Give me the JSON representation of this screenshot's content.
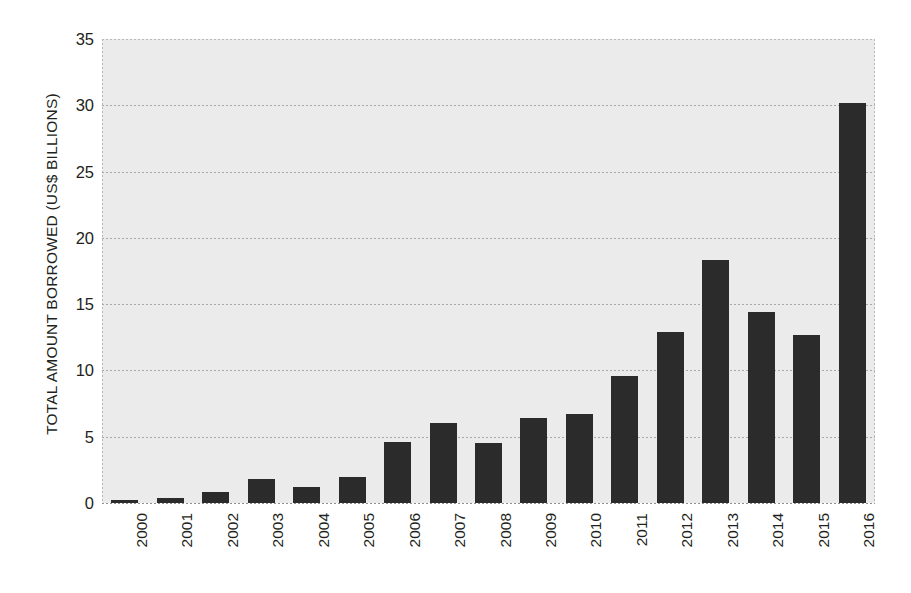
{
  "chart_data": {
    "type": "bar",
    "title": "",
    "xlabel": "",
    "ylabel": "TOTAL AMOUNT BORROWED (US$ BILLIONS)",
    "categories": [
      "2000",
      "2001",
      "2002",
      "2003",
      "2004",
      "2005",
      "2006",
      "2007",
      "2008",
      "2009",
      "2010",
      "2011",
      "2012",
      "2013",
      "2014",
      "2015",
      "2016"
    ],
    "values": [
      0.2,
      0.4,
      0.8,
      1.8,
      1.2,
      2.0,
      4.6,
      6.0,
      4.5,
      6.4,
      6.7,
      9.6,
      12.9,
      18.3,
      14.4,
      12.7,
      30.2
    ],
    "ylim": [
      0,
      35
    ],
    "ytick_labels": [
      "0",
      "5",
      "10",
      "15",
      "20",
      "25",
      "30",
      "35"
    ],
    "ytick_values": [
      0,
      5,
      10,
      15,
      20,
      25,
      30,
      35
    ],
    "grid": true,
    "legend": "none",
    "colors": {
      "bar": "#2b2b2b",
      "plot_background": "#ebebeb",
      "gridline": "#a8a8a8",
      "text": "#231f20",
      "page_background": "#ffffff"
    }
  }
}
